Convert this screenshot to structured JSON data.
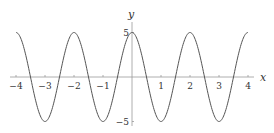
{
  "chart_data": {
    "type": "line",
    "title": "",
    "xlabel": "x",
    "ylabel": "y",
    "function": "y = 5cos(πx)",
    "xlim": [
      -4,
      4
    ],
    "ylim": [
      -5,
      5
    ],
    "x_ticks": [
      "-4",
      "-3",
      "-2",
      "-1",
      "1",
      "2",
      "3",
      "4"
    ],
    "y_ticks": [
      "5",
      "-5"
    ],
    "grid": false,
    "legend": "none",
    "series": [
      {
        "name": "5cos(πx)",
        "x": [
          -4,
          -3.5,
          -3,
          -2.5,
          -2,
          -1.5,
          -1,
          -0.5,
          0,
          0.5,
          1,
          1.5,
          2,
          2.5,
          3,
          3.5,
          4
        ],
        "values": [
          5,
          0,
          -5,
          0,
          5,
          0,
          -5,
          0,
          5,
          0,
          -5,
          0,
          5,
          0,
          -5,
          0,
          5
        ]
      }
    ],
    "colors": {
      "curve": "#555555",
      "axes": "#888888"
    }
  }
}
